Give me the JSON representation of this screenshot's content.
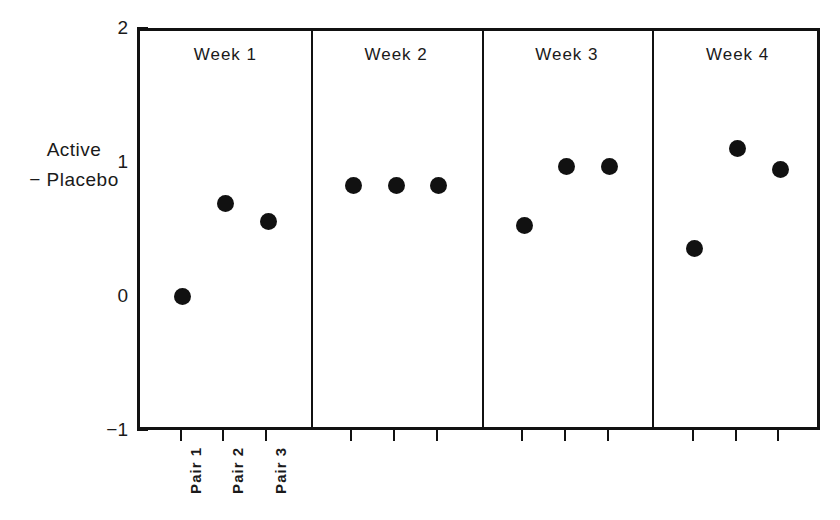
{
  "chart_data": {
    "type": "scatter",
    "title": "",
    "subtitle": "",
    "xlabel": "",
    "ylabel": "Active − Placebo",
    "ylabel_lines": [
      "Active",
      "− Placebo"
    ],
    "ylim": [
      -1,
      2
    ],
    "ytick_labels": [
      "2",
      "1",
      "0",
      "−1"
    ],
    "ytick_values": [
      2,
      1,
      0,
      -1
    ],
    "grid": false,
    "legend": null,
    "panel_labels": [
      "Week 1",
      "Week 2",
      "Week 3",
      "Week 4"
    ],
    "categories": [
      "Pair 1",
      "Pair 2",
      "Pair 3"
    ],
    "xtick_labels": [
      "Pair 1",
      "Pair 2",
      "Pair 3"
    ],
    "xtick_labels_shown_for_panel": "Week 1",
    "marker": "filled-circle",
    "marker_color": "#111111",
    "frame_color": "#111111",
    "background_color": "#ffffff",
    "panels": [
      {
        "label": "Week 1",
        "points": [
          {
            "category": "Pair 1",
            "value": 0.02
          },
          {
            "category": "Pair 2",
            "value": 0.71
          },
          {
            "category": "Pair 3",
            "value": 0.58
          }
        ]
      },
      {
        "label": "Week 2",
        "points": [
          {
            "category": "Pair 1",
            "value": 0.85
          },
          {
            "category": "Pair 2",
            "value": 0.85
          },
          {
            "category": "Pair 3",
            "value": 0.85
          }
        ]
      },
      {
        "label": "Week 3",
        "points": [
          {
            "category": "Pair 1",
            "value": 0.55
          },
          {
            "category": "Pair 2",
            "value": 0.99
          },
          {
            "category": "Pair 3",
            "value": 0.99
          }
        ]
      },
      {
        "label": "Week 4",
        "points": [
          {
            "category": "Pair 1",
            "value": 0.38
          },
          {
            "category": "Pair 2",
            "value": 1.12
          },
          {
            "category": "Pair 3",
            "value": 0.97
          }
        ]
      }
    ],
    "series": [
      {
        "name": "Pair 1",
        "x": [
          "Week 1",
          "Week 2",
          "Week 3",
          "Week 4"
        ],
        "values": [
          0.02,
          0.85,
          0.55,
          0.38
        ]
      },
      {
        "name": "Pair 2",
        "x": [
          "Week 1",
          "Week 2",
          "Week 3",
          "Week 4"
        ],
        "values": [
          0.71,
          0.85,
          0.99,
          1.12
        ]
      },
      {
        "name": "Pair 3",
        "x": [
          "Week 1",
          "Week 2",
          "Week 3",
          "Week 4"
        ],
        "values": [
          0.58,
          0.85,
          0.99,
          0.97
        ]
      }
    ]
  }
}
